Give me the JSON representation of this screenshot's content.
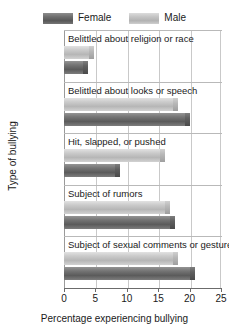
{
  "chart_data": {
    "type": "bar",
    "orientation": "horizontal",
    "title": "",
    "xlabel": "Percentage experiencing bullying",
    "ylabel": "Type of bullying",
    "xlim": [
      0,
      25
    ],
    "xticks": [
      0,
      5,
      10,
      15,
      20,
      25
    ],
    "grid": true,
    "legend_position": "top",
    "categories": [
      "Belittled about religion or race",
      "Belittled about looks or speech",
      "Hit, slapped, or pushed",
      "Subject of rumors",
      "Subject of sexual comments or gestures"
    ],
    "series": [
      {
        "name": "Male",
        "color": "#c4c4c4",
        "values": [
          4.1,
          17.5,
          15.5,
          16.2,
          17.5
        ]
      },
      {
        "name": "Female",
        "color": "#6e6e6e",
        "values": [
          3.2,
          19.4,
          8.3,
          17.1,
          20.2
        ]
      }
    ]
  },
  "legend": {
    "entries": [
      {
        "label": "Female",
        "swatch": "female-swatch"
      },
      {
        "label": "Male",
        "swatch": "male-swatch"
      }
    ]
  },
  "axes": {
    "x_title": "Percentage experiencing bullying",
    "y_title": "Type of bullying",
    "x_tick_labels": [
      "0",
      "5",
      "10",
      "15",
      "20",
      "25"
    ]
  }
}
